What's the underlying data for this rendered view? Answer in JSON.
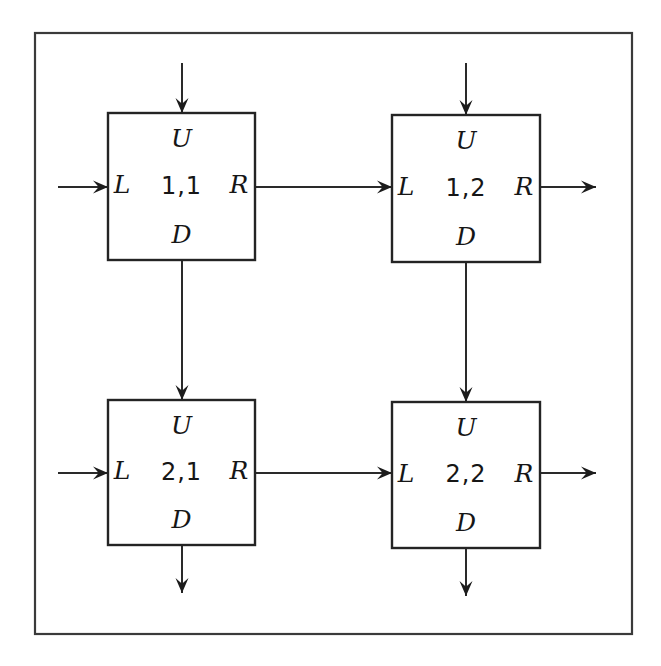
{
  "diagram": {
    "background_color": "#ffffff",
    "frame": {
      "name": "outer-frame",
      "x": 35,
      "y": 33,
      "width": 597,
      "height": 601,
      "stroke_color": "#3a3a3a"
    },
    "cell_stroke_color": "#242424",
    "line_color": "#2a2a2a",
    "ports": {
      "up": "U",
      "left": "L",
      "right": "R",
      "down": "D"
    },
    "cells": [
      {
        "id": "1,1",
        "name": "cell-1-1",
        "row": 1,
        "col": 1,
        "x": 108,
        "y": 113,
        "width": 147,
        "height": 147,
        "label_up": "U",
        "label_left": "L",
        "label_right": "R",
        "label_down": "D"
      },
      {
        "id": "1,2",
        "name": "cell-1-2",
        "row": 1,
        "col": 2,
        "x": 392,
        "y": 115,
        "width": 148,
        "height": 147,
        "label_up": "U",
        "label_left": "L",
        "label_right": "R",
        "label_down": "D"
      },
      {
        "id": "2,1",
        "name": "cell-2-1",
        "row": 2,
        "col": 1,
        "x": 108,
        "y": 400,
        "width": 147,
        "height": 145,
        "label_up": "U",
        "label_left": "L",
        "label_right": "R",
        "label_down": "D"
      },
      {
        "id": "2,2",
        "name": "cell-2-2",
        "row": 2,
        "col": 2,
        "x": 392,
        "y": 402,
        "width": 148,
        "height": 146,
        "label_up": "U",
        "label_left": "L",
        "label_right": "R",
        "label_down": "D"
      }
    ],
    "connections": [
      {
        "name": "input-top-cell-1-1",
        "from": [
          182,
          63
        ],
        "to": [
          182,
          113
        ],
        "orientation": "vertical",
        "kind": "external-input"
      },
      {
        "name": "input-left-cell-1-1",
        "from": [
          58,
          187
        ],
        "to": [
          108,
          187
        ],
        "orientation": "horizontal",
        "kind": "external-input"
      },
      {
        "name": "input-top-cell-1-2",
        "from": [
          466,
          63
        ],
        "to": [
          466,
          115
        ],
        "orientation": "vertical",
        "kind": "external-input"
      },
      {
        "name": "input-left-cell-2-1",
        "from": [
          58,
          473
        ],
        "to": [
          108,
          473
        ],
        "orientation": "horizontal",
        "kind": "external-input"
      },
      {
        "name": "link-cell-1-1-to-1-2",
        "from": [
          255,
          187
        ],
        "to": [
          392,
          187
        ],
        "orientation": "horizontal",
        "kind": "internal-link"
      },
      {
        "name": "link-cell-1-1-to-2-1",
        "from": [
          182,
          260
        ],
        "to": [
          182,
          400
        ],
        "orientation": "vertical",
        "kind": "internal-link"
      },
      {
        "name": "link-cell-1-2-to-2-2",
        "from": [
          466,
          262
        ],
        "to": [
          466,
          402
        ],
        "orientation": "vertical",
        "kind": "internal-link"
      },
      {
        "name": "link-cell-2-1-to-2-2",
        "from": [
          255,
          473
        ],
        "to": [
          392,
          473
        ],
        "orientation": "horizontal",
        "kind": "internal-link"
      },
      {
        "name": "output-right-cell-1-2",
        "from": [
          540,
          187
        ],
        "to": [
          596,
          187
        ],
        "orientation": "horizontal",
        "kind": "external-output"
      },
      {
        "name": "output-right-cell-2-2",
        "from": [
          540,
          473
        ],
        "to": [
          596,
          473
        ],
        "orientation": "horizontal",
        "kind": "external-output"
      },
      {
        "name": "output-bottom-cell-2-1",
        "from": [
          182,
          545
        ],
        "to": [
          182,
          593
        ],
        "orientation": "vertical",
        "kind": "external-output"
      },
      {
        "name": "output-bottom-cell-2-2",
        "from": [
          466,
          548
        ],
        "to": [
          466,
          596
        ],
        "orientation": "vertical",
        "kind": "external-output"
      }
    ]
  }
}
